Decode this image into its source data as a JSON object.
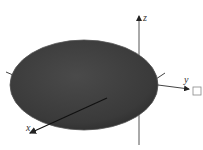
{
  "diagram": {
    "type": "3d-ellipsoid-with-axes",
    "axes": {
      "x_label": "x",
      "y_label": "y",
      "z_label": "z"
    },
    "colors": {
      "ellipsoid_fill": "#3f3f3f",
      "ellipsoid_edge": "#555555",
      "axis": "#333333",
      "background": "#ffffff"
    }
  }
}
